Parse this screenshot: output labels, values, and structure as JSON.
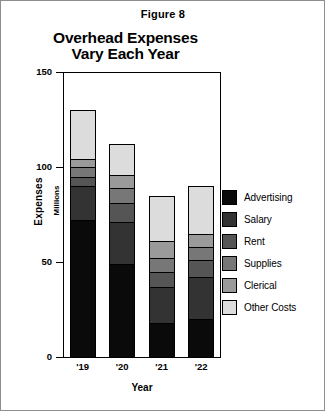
{
  "figure": {
    "caption": "Figure 8"
  },
  "chart_data": {
    "type": "bar",
    "subtype": "stacked-vertical",
    "title": "Overhead Expenses Vary Each Year",
    "title_line1": "Overhead Expenses",
    "title_line2": "Vary Each Year",
    "xlabel": "Year",
    "ylabel": "Expenses",
    "ylabel_sub": "Millions",
    "categories": [
      "'19",
      "'20",
      "'21",
      "'22"
    ],
    "ylim": [
      0,
      150
    ],
    "yticks": [
      0,
      50,
      100,
      150
    ],
    "ytick_labels": [
      "0",
      "50",
      "100",
      "150"
    ],
    "grid": false,
    "legend_position": "right",
    "series": [
      {
        "name": "Advertising",
        "color": "#0a0a0a",
        "values": [
          72,
          49,
          18,
          20
        ]
      },
      {
        "name": "Salary",
        "color": "#333333",
        "values": [
          18,
          22,
          19,
          22
        ]
      },
      {
        "name": "Rent",
        "color": "#555555",
        "values": [
          5,
          10,
          8,
          9
        ]
      },
      {
        "name": "Supplies",
        "color": "#777777",
        "values": [
          5,
          8,
          7,
          7
        ]
      },
      {
        "name": "Clerical",
        "color": "#9a9a9a",
        "values": [
          4,
          7,
          9,
          7
        ]
      },
      {
        "name": "Other Costs",
        "color": "#dcdcdc",
        "values": [
          26,
          16,
          24,
          25
        ]
      }
    ],
    "totals": [
      130,
      112,
      85,
      90
    ]
  }
}
